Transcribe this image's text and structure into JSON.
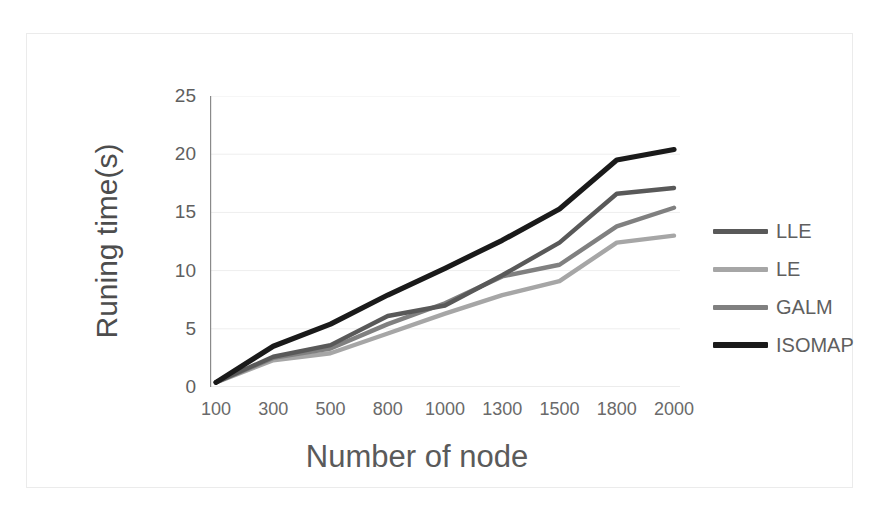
{
  "chart_data": {
    "type": "line",
    "title": "",
    "xlabel": "Number of node",
    "ylabel": "Runing time(s)",
    "categories": [
      "100",
      "300",
      "500",
      "800",
      "1000",
      "1300",
      "1500",
      "1800",
      "2000"
    ],
    "ylim": [
      0,
      25
    ],
    "yticks": [
      "0",
      "5",
      "10",
      "15",
      "20",
      "25"
    ],
    "grid": true,
    "legend_position": "right",
    "series": [
      {
        "name": "LLE",
        "color": "#595959",
        "values": [
          0.4,
          2.6,
          3.6,
          6.1,
          7.0,
          9.6,
          12.4,
          16.6,
          17.1
        ]
      },
      {
        "name": "LE",
        "color": "#a6a6a6",
        "values": [
          0.4,
          2.3,
          2.9,
          4.6,
          6.3,
          7.9,
          9.1,
          12.4,
          13.0
        ]
      },
      {
        "name": "GALM",
        "color": "#808080",
        "values": [
          0.4,
          2.5,
          3.3,
          5.4,
          7.2,
          9.5,
          10.5,
          13.8,
          15.4
        ]
      },
      {
        "name": "ISOMAP",
        "color": "#1a1a1a",
        "values": [
          0.4,
          3.5,
          5.4,
          7.9,
          10.2,
          12.6,
          15.3,
          19.5,
          20.4
        ]
      }
    ]
  }
}
